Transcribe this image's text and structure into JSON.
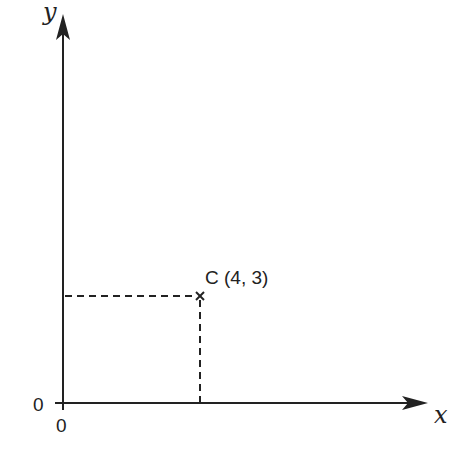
{
  "diagram": {
    "axes": {
      "x_label": "x",
      "y_label": "y",
      "origin_x_label": "0",
      "origin_y_label": "0"
    },
    "point": {
      "name": "C",
      "label": "C (4, 3)",
      "x": 4,
      "y": 3,
      "marker": "cross"
    },
    "guides": {
      "horizontal": "dashed line from y-axis at y=3 to point C",
      "vertical": "dashed line from x-axis at x=4 to point C"
    },
    "colors": {
      "line": "#222222",
      "background": "#ffffff"
    }
  }
}
